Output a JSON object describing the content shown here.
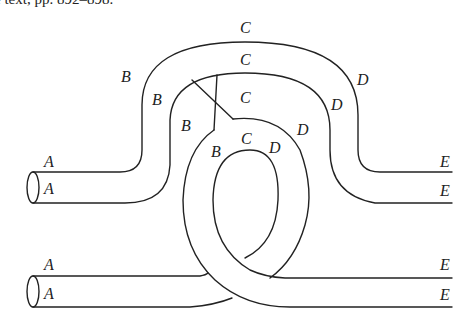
{
  "caption": "e text, pp. 892–898.",
  "diagram": {
    "labels": {
      "outer_top_C": "C",
      "mid_top_C": "C",
      "inner_top_C": "C",
      "loop_C": "C",
      "outer_B": "B",
      "mid_B": "B",
      "inner_B": "B",
      "loop_B": "B",
      "outer_D": "D",
      "mid_D": "D",
      "inner_D": "D",
      "loop_D": "D",
      "upper_A_top": "A",
      "upper_A_bottom": "A",
      "lower_A_top": "A",
      "lower_A_bottom": "A",
      "upper_E_top": "E",
      "upper_E_bottom": "E",
      "lower_E_top": "E",
      "lower_E_bottom": "E"
    }
  }
}
